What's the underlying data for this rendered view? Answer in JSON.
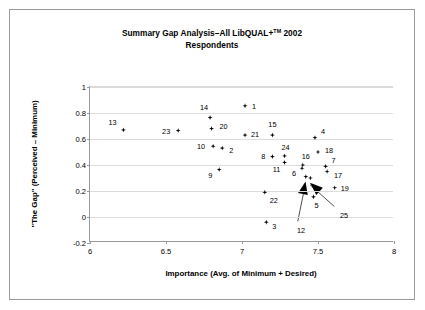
{
  "figure": {
    "title_line1": "Summary Gap Analysis–All LibQUAL+",
    "title_superscript": "TM",
    "title_line1_tail": " 2002",
    "title_line2": "Respondents"
  },
  "chart_data": {
    "type": "scatter",
    "xlabel": "Importance (Avg. of Minimum + Desired)",
    "ylabel": "\"The Gap\" (Perceived  –  Minimum)",
    "xlim": [
      6,
      8
    ],
    "ylim": [
      -0.2,
      1
    ],
    "xticks": [
      "6",
      "6.5",
      "7",
      "7.5",
      "8"
    ],
    "xtick_values": [
      6,
      6.5,
      7,
      7.5,
      8
    ],
    "yticks": [
      "1",
      "0.8",
      "0.6",
      "0.4",
      "0.2",
      "0",
      "-0.2"
    ],
    "ytick_values": [
      1,
      0.8,
      0.6,
      0.4,
      0.2,
      0,
      -0.2
    ],
    "grid": "horizontal",
    "legend": "none",
    "marker": "diamond-star",
    "marker_color": "#000000",
    "points": [
      {
        "label": "13",
        "x": 6.22,
        "y": 0.67,
        "label_dx": -11,
        "label_dy": -8
      },
      {
        "label": "23",
        "x": 6.58,
        "y": 0.665,
        "label_dx": -12,
        "label_dy": 0
      },
      {
        "label": "14",
        "x": 6.79,
        "y": 0.765,
        "label_dx": -6,
        "label_dy": -11
      },
      {
        "label": "20",
        "x": 6.8,
        "y": 0.68,
        "label_dx": 12,
        "label_dy": -3
      },
      {
        "label": "10",
        "x": 6.81,
        "y": 0.545,
        "label_dx": -12,
        "label_dy": 0
      },
      {
        "label": "2",
        "x": 6.87,
        "y": 0.53,
        "label_dx": 9,
        "label_dy": 2
      },
      {
        "label": "9",
        "x": 6.85,
        "y": 0.365,
        "label_dx": -9,
        "label_dy": 5
      },
      {
        "label": "1",
        "x": 7.02,
        "y": 0.855,
        "label_dx": 9,
        "label_dy": 0
      },
      {
        "label": "21",
        "x": 7.02,
        "y": 0.63,
        "label_dx": 10,
        "label_dy": -1
      },
      {
        "label": "15",
        "x": 7.2,
        "y": 0.63,
        "label_dx": 0,
        "label_dy": -11
      },
      {
        "label": "8",
        "x": 7.2,
        "y": 0.465,
        "label_dx": -9,
        "label_dy": -1
      },
      {
        "label": "24",
        "x": 7.28,
        "y": 0.47,
        "label_dx": 1,
        "label_dy": -9
      },
      {
        "label": "11",
        "x": 7.28,
        "y": 0.42,
        "label_dx": -8,
        "label_dy": 7
      },
      {
        "label": "22",
        "x": 7.15,
        "y": 0.19,
        "label_dx": 9,
        "label_dy": 8
      },
      {
        "label": "3",
        "x": 7.16,
        "y": -0.04,
        "label_dx": 8,
        "label_dy": 4
      },
      {
        "label": "4",
        "x": 7.48,
        "y": 0.61,
        "label_dx": 8,
        "label_dy": -7
      },
      {
        "label": "18",
        "x": 7.5,
        "y": 0.5,
        "label_dx": 11,
        "label_dy": -2
      },
      {
        "label": "16",
        "x": 7.4,
        "y": 0.4,
        "label_dx": 3,
        "label_dy": -9
      },
      {
        "label": "6",
        "x": 7.395,
        "y": 0.375,
        "label_dx": -8,
        "label_dy": 5
      },
      {
        "label": "7",
        "x": 7.55,
        "y": 0.39,
        "label_dx": 8,
        "label_dy": -6
      },
      {
        "label": "17",
        "x": 7.56,
        "y": 0.35,
        "label_dx": 11,
        "label_dy": 3
      },
      {
        "label": "19",
        "x": 7.61,
        "y": 0.225,
        "label_dx": 10,
        "label_dy": 0
      },
      {
        "label": "5",
        "x": 7.47,
        "y": 0.155,
        "label_dx": 3,
        "label_dy": 8
      }
    ],
    "annotated_points": [
      {
        "label": "12",
        "x": 7.42,
        "y": 0.31,
        "label_px": 299,
        "label_py": 228,
        "arrow_from_px": 297,
        "arrow_from_py": 221
      },
      {
        "label": "25",
        "x": 7.45,
        "y": 0.3,
        "label_px": 342,
        "label_py": 213,
        "arrow_from_px": 334,
        "arrow_from_py": 206
      }
    ]
  }
}
